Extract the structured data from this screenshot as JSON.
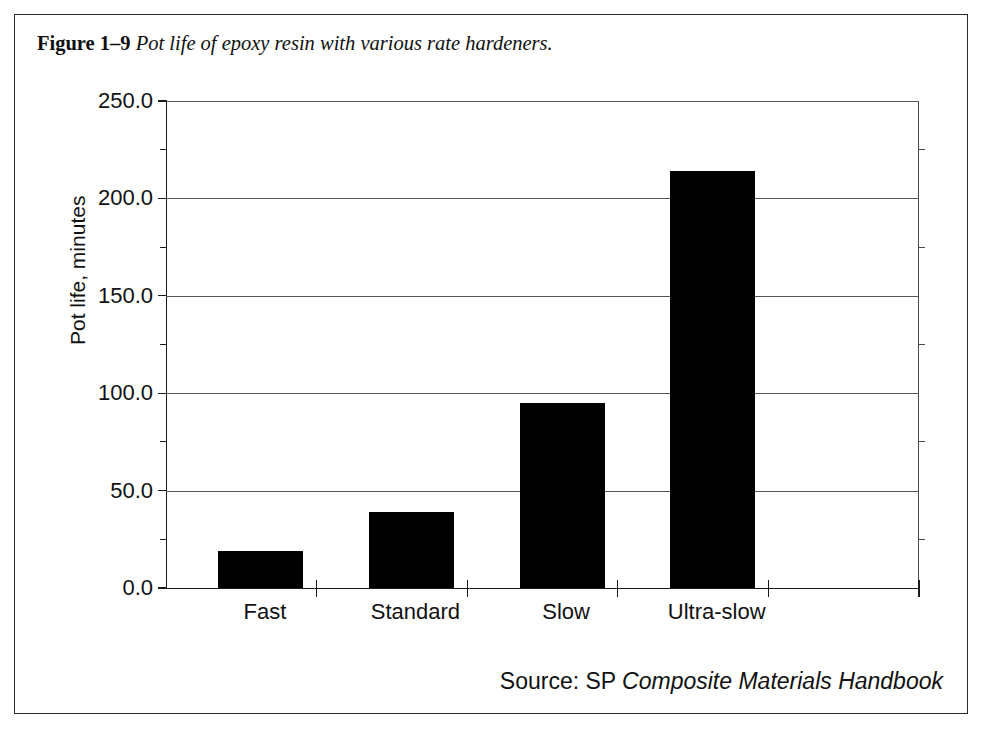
{
  "figure": {
    "number": "Figure 1–9",
    "title": "Pot life of epoxy resin with various rate hardeners.",
    "source_prefix": "Source: SP ",
    "source_italic": "Composite Materials Handbook"
  },
  "chart_data": {
    "type": "bar",
    "title": "Pot life of epoxy resin with various rate hardeners.",
    "categories": [
      "Fast",
      "Standard",
      "Slow",
      "Ultra-slow"
    ],
    "values": [
      19,
      39,
      95,
      214
    ],
    "xlabel": "",
    "ylabel": "Pot life, minutes",
    "ylim": [
      0,
      250
    ],
    "ytick_labels": [
      "0.0",
      "50.0",
      "100.0",
      "150.0",
      "200.0",
      "250.0"
    ],
    "ytick_values": [
      0,
      50,
      100,
      150,
      200,
      250
    ],
    "yminor_values": [
      25,
      75,
      125,
      175,
      225
    ],
    "grid": true,
    "legend": false,
    "bar_color": "#000000",
    "axis_color": "#1a1a1a",
    "grid_color": "#555555"
  }
}
